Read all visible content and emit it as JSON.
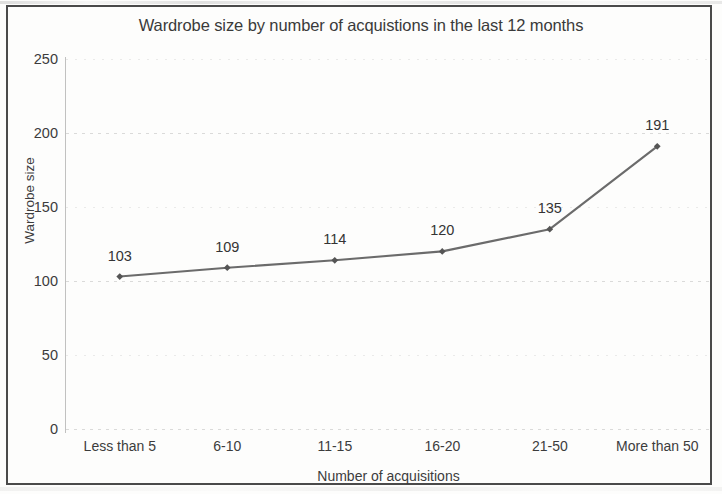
{
  "chart_data": {
    "type": "line",
    "title": "Wardrobe size by number of acquistions in the last 12 months",
    "xlabel": "Number of acquisitions",
    "ylabel": "Wardrobe size",
    "categories": [
      "Less than 5",
      "6-10",
      "11-15",
      "16-20",
      "21-50",
      "More than 50"
    ],
    "values": [
      103,
      109,
      114,
      120,
      135,
      191
    ],
    "data_labels": [
      "103",
      "109",
      "114",
      "120",
      "135",
      "191"
    ],
    "ylim": [
      0,
      250
    ],
    "yticks": [
      0,
      50,
      100,
      150,
      200,
      250
    ],
    "ytick_labels": [
      "0",
      "50",
      "100",
      "150",
      "200",
      "250"
    ],
    "grid": true,
    "grid_axis": "y",
    "legend": false,
    "series_color": "#6b6b6b",
    "marker": "diamond",
    "marker_color": "#555555",
    "text_color": "#3c3c3c",
    "border_color": "#4a4a4a",
    "background_color": "#fdfdfc"
  }
}
